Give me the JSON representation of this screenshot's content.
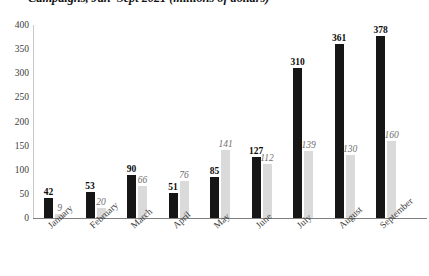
{
  "chart_data": {
    "type": "bar",
    "title": "Campaigns, Jan–Sept 2021 (millions of dollars)",
    "xlabel": "",
    "ylabel": "",
    "ylim": [
      0,
      400
    ],
    "yticks": [
      400,
      350,
      300,
      250,
      200,
      150,
      100,
      50,
      0
    ],
    "ytick_labels": [
      "400",
      "350",
      "300",
      "250",
      "200",
      "150",
      "100",
      "50",
      "0"
    ],
    "grid": false,
    "legend": "none",
    "categories": [
      "January",
      "February",
      "March",
      "April",
      "May",
      "June",
      "July",
      "August",
      "September"
    ],
    "series": [
      {
        "name": "primary",
        "color": "#161616",
        "values": [
          42,
          53,
          90,
          51,
          85,
          127,
          310,
          361,
          378
        ],
        "labels": [
          "42",
          "53",
          "90",
          "51",
          "85",
          "127",
          "310",
          "361",
          "378"
        ]
      },
      {
        "name": "secondary",
        "color": "#dadada",
        "values": [
          9,
          20,
          66,
          76,
          141,
          112,
          139,
          130,
          160
        ],
        "labels": [
          "9",
          "20",
          "66",
          "76",
          "141",
          "112",
          "139",
          "130",
          "160"
        ]
      }
    ]
  },
  "colors": {
    "primary_bar": "#161616",
    "secondary_bar": "#dadada",
    "axis": "#7f7f7f",
    "text": "#3d3d3d",
    "background": "#ffffff"
  }
}
